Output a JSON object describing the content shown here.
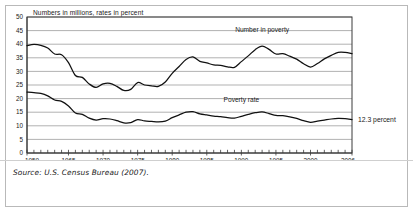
{
  "figure": {
    "title": "Numbers in millions, rates in percent",
    "source": "Source: U.S. Census Bureau (2007).",
    "annotation": "12.3 percent",
    "label_number": "Number in poverty",
    "label_rate": "Poverty rate"
  },
  "chart_data": {
    "type": "line",
    "title": "Numbers in millions, rates in percent",
    "xlabel": "",
    "ylabel": "",
    "xlim": [
      1959,
      2006
    ],
    "ylim": [
      0,
      50
    ],
    "ytick_step": 5,
    "yticks": [
      0,
      5,
      10,
      15,
      20,
      25,
      30,
      35,
      40,
      45,
      50
    ],
    "ytick_labels": [
      "0",
      "5",
      "10",
      "15",
      "20",
      "25",
      "30",
      "35",
      "40",
      "45",
      "50"
    ],
    "xticks": [
      1959,
      1965,
      1970,
      1975,
      1980,
      1985,
      1990,
      1995,
      2000,
      2006
    ],
    "xtick_labels": [
      "1959",
      "1965",
      "1970",
      "1975",
      "1980",
      "1985",
      "1990",
      "1995",
      "2000",
      "2006"
    ],
    "minor_xticks_every": 1,
    "grid": "horizontal",
    "legend": "inline-labels",
    "annotations": [
      {
        "text": "12.3 percent",
        "x": 2006,
        "y": 12.3,
        "position": "right-outside"
      },
      {
        "text": "Number in poverty",
        "x": 1993,
        "y": 44.5,
        "position": "above-series"
      },
      {
        "text": "Poverty rate",
        "x": 1990,
        "y": 18.5,
        "position": "above-series"
      }
    ],
    "x": [
      1959,
      1960,
      1961,
      1962,
      1963,
      1964,
      1965,
      1966,
      1967,
      1968,
      1969,
      1970,
      1971,
      1972,
      1973,
      1974,
      1975,
      1976,
      1977,
      1978,
      1979,
      1980,
      1981,
      1982,
      1983,
      1984,
      1985,
      1986,
      1987,
      1988,
      1989,
      1990,
      1991,
      1992,
      1993,
      1994,
      1995,
      1996,
      1997,
      1998,
      1999,
      2000,
      2001,
      2002,
      2003,
      2004,
      2005,
      2006
    ],
    "series": [
      {
        "name": "Number in poverty",
        "units": "millions",
        "values": [
          39.5,
          39.9,
          39.6,
          38.6,
          36.4,
          36.1,
          33.2,
          28.5,
          27.8,
          25.4,
          24.1,
          25.4,
          25.6,
          24.5,
          23.0,
          23.4,
          25.9,
          25.0,
          24.7,
          24.5,
          26.1,
          29.3,
          31.8,
          34.4,
          35.3,
          33.7,
          33.1,
          32.4,
          32.2,
          31.7,
          31.5,
          33.6,
          35.7,
          38.0,
          39.3,
          38.1,
          36.4,
          36.5,
          35.6,
          34.5,
          32.8,
          31.6,
          32.9,
          34.6,
          35.9,
          37.0,
          37.0,
          36.5
        ]
      },
      {
        "name": "Poverty rate",
        "units": "percent",
        "values": [
          22.4,
          22.2,
          21.9,
          21.0,
          19.5,
          19.0,
          17.3,
          14.7,
          14.2,
          12.8,
          12.1,
          12.6,
          12.5,
          11.9,
          11.1,
          11.2,
          12.3,
          11.8,
          11.6,
          11.4,
          11.7,
          13.0,
          14.0,
          15.0,
          15.2,
          14.4,
          14.0,
          13.6,
          13.4,
          13.0,
          12.8,
          13.5,
          14.2,
          14.8,
          15.1,
          14.5,
          13.8,
          13.7,
          13.3,
          12.7,
          11.9,
          11.3,
          11.7,
          12.1,
          12.5,
          12.7,
          12.6,
          12.3
        ]
      }
    ]
  }
}
